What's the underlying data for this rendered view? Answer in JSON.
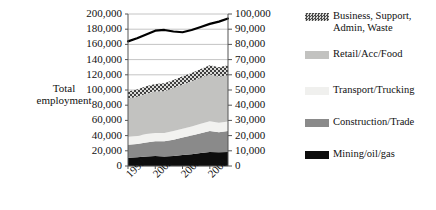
{
  "chart_data": {
    "type": "area",
    "title": "",
    "xlabel": "",
    "ylabel": "Total employment",
    "ylabel_line1": "Total",
    "ylabel_line2": "employment",
    "grid": true,
    "legend_position": "right",
    "x": [
      1999,
      2000,
      2001,
      2002,
      2003,
      2004,
      2005,
      2006,
      2007,
      2008,
      2009,
      2010
    ],
    "xtick_labels": [
      "1999",
      "2002",
      "2005",
      "2008"
    ],
    "xtick_values": [
      1999,
      2002,
      2005,
      2008
    ],
    "left_axis": {
      "label": "Total employment",
      "ylim": [
        0,
        200000
      ],
      "tick_step": 20000,
      "ticks": [
        "0",
        "20,000",
        "40,000",
        "60,000",
        "80,000",
        "100,000",
        "120,000",
        "140,000",
        "160,000",
        "180,000",
        "200,000"
      ]
    },
    "right_axis": {
      "ylim": [
        0,
        100000
      ],
      "tick_step": 10000,
      "ticks": [
        "0",
        "10,000",
        "20,000",
        "30,000",
        "40,000",
        "50,000",
        "60,000",
        "70,000",
        "80,000",
        "90,000",
        "100,000"
      ]
    },
    "stacked_series": [
      {
        "name": "Mining/oil/gas",
        "color": "#0d0d0d",
        "pattern": "solid",
        "axis": "left",
        "values": [
          11000,
          11500,
          12500,
          13000,
          12500,
          13000,
          14500,
          15500,
          17000,
          18500,
          18000,
          18500
        ]
      },
      {
        "name": "Construction/Trade",
        "color": "#8a8a8a",
        "pattern": "solid",
        "axis": "left",
        "values": [
          17000,
          17500,
          18500,
          19500,
          20000,
          21500,
          23000,
          24500,
          26000,
          27500,
          26500,
          27500
        ]
      },
      {
        "name": "Transport/Trucking",
        "color": "#f2f2f0",
        "pattern": "solid",
        "axis": "left",
        "values": [
          10500,
          10500,
          11000,
          11000,
          11000,
          11500,
          11500,
          12000,
          12500,
          13000,
          12500,
          12500
        ]
      },
      {
        "name": "Retail/Acc/Food",
        "color": "#c2c2c0",
        "pattern": "solid",
        "axis": "left",
        "values": [
          50000,
          51500,
          53000,
          54500,
          55000,
          56500,
          58000,
          59500,
          60500,
          61500,
          60500,
          61000
        ]
      },
      {
        "name": "Business, Support, Admin, Waste",
        "color": "#4a4a4a",
        "pattern": "checker",
        "axis": "left",
        "values": [
          9500,
          9500,
          10000,
          10000,
          10500,
          10500,
          11000,
          11000,
          11500,
          12000,
          12500,
          13000
        ]
      }
    ],
    "line_series": {
      "name": "Total employment",
      "color": "#000000",
      "axis": "right",
      "values": [
        82000,
        84000,
        86500,
        89000,
        89500,
        88500,
        88000,
        89500,
        91500,
        93500,
        95000,
        97000
      ]
    },
    "annotations": []
  },
  "legend": {
    "entries": [
      {
        "label": "Business, Support, Admin, Waste",
        "swatch": "checker-dark",
        "color": "#4a4a4a"
      },
      {
        "label": "Retail/Acc/Food",
        "swatch": "solid",
        "color": "#c2c2c0"
      },
      {
        "label": "Transport/Trucking",
        "swatch": "solid",
        "color": "#f0f0ee"
      },
      {
        "label": "Construction/Trade",
        "swatch": "solid",
        "color": "#8a8a8a"
      },
      {
        "label": "Mining/oil/gas",
        "swatch": "solid",
        "color": "#0d0d0d"
      }
    ]
  }
}
